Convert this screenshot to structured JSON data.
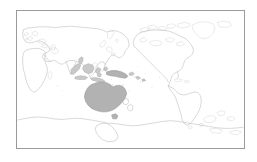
{
  "figure": {
    "kind": "distribution-map",
    "title": "",
    "caption": "",
    "background_color": "#ffffff"
  },
  "map": {
    "projection": "equirectangular",
    "centered_on": "Pacific",
    "center_longitude": 160,
    "lon_range": [
      -20,
      340
    ],
    "lat_range": [
      -85,
      85
    ],
    "frame_color": "#9a9a9a",
    "ocean_color": "#ffffff",
    "coastline_color": "#b9b9b9",
    "graticule_shown": false,
    "labels_shown": false,
    "scalebar_shown": false,
    "north_arrow_shown": false,
    "legend_shown": false
  },
  "highlight": {
    "label": "",
    "fill_color": "#b2b2b2",
    "secondary_fill_color": "#c9c9c9",
    "outline_color": "#8e8e8e",
    "regions": [
      "Australia",
      "Tasmania",
      "New Guinea",
      "Indonesia",
      "Borneo",
      "Sulawesi",
      "Java",
      "Sumatra",
      "Timor",
      "New Britain",
      "Solomon Islands"
    ]
  },
  "landmasses": [
    {
      "name": "Eurasia",
      "shaded": false
    },
    {
      "name": "Africa",
      "shaded": false
    },
    {
      "name": "North America",
      "shaded": false
    },
    {
      "name": "South America",
      "shaded": false
    },
    {
      "name": "Antarctica",
      "shaded": false
    },
    {
      "name": "Greenland",
      "shaded": false
    },
    {
      "name": "Australia",
      "shaded": true
    },
    {
      "name": "New Guinea",
      "shaded": true
    },
    {
      "name": "Indonesia",
      "shaded": true
    },
    {
      "name": "New Zealand",
      "shaded": false
    },
    {
      "name": "Japan",
      "shaded": false
    },
    {
      "name": "Madagascar",
      "shaded": false
    },
    {
      "name": "British Isles",
      "shaded": false
    },
    {
      "name": "Philippines",
      "shaded": false
    }
  ]
}
